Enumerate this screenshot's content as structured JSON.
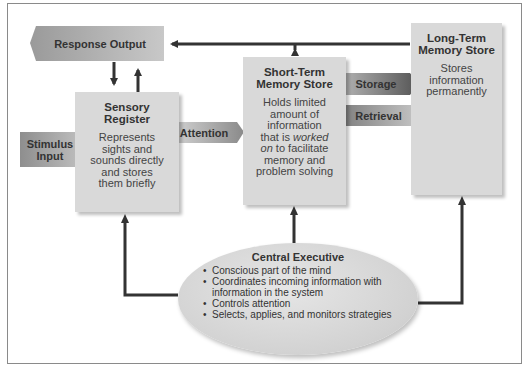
{
  "diagram": {
    "response_output": {
      "label": "Response Output"
    },
    "stimulus_input": {
      "label": "Stimulus Input",
      "line1": "Stimulus",
      "line2": "Input"
    },
    "sensory_register": {
      "title_line1": "Sensory",
      "title_line2": "Register",
      "desc_lines": [
        "Represents",
        "sights and",
        "sounds directly",
        "and stores",
        "them briefly"
      ]
    },
    "attention": {
      "label": "Attention"
    },
    "short_term": {
      "title_line1": "Short-Term",
      "title_line2": "Memory Store",
      "desc_lines": [
        "Holds limited",
        "amount of",
        "information",
        "that is ",
        "worked",
        "on",
        " to facilitate",
        "memory and",
        "problem solving"
      ]
    },
    "storage": {
      "label": "Storage"
    },
    "retrieval": {
      "label": "Retrieval"
    },
    "long_term": {
      "title_line1": "Long-Term",
      "title_line2": "Memory Store",
      "desc_lines": [
        "Stores",
        "information",
        "permanently"
      ]
    },
    "central_executive": {
      "title": "Central Executive",
      "items": [
        "Conscious part of the mind",
        "Coordinates incoming information with",
        "information in the system",
        "Controls attention",
        "Selects, applies, and monitors strategies"
      ]
    }
  }
}
